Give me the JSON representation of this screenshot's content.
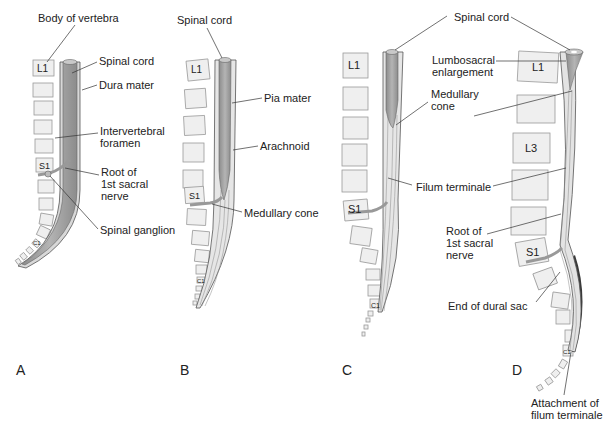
{
  "panels": [
    {
      "id": "A",
      "letter": "A",
      "vertebra_labels": [
        "L1",
        "S1",
        "C1"
      ],
      "labels": [
        {
          "text": "Body of vertebra"
        },
        {
          "text": "Spinal cord"
        },
        {
          "text": "Dura mater"
        },
        {
          "text": "Intervertebral\nforamen"
        },
        {
          "text": "Root of\n1st sacral\nnerve"
        },
        {
          "text": "Spinal ganglion"
        }
      ]
    },
    {
      "id": "B",
      "letter": "B",
      "vertebra_labels": [
        "L1",
        "S1",
        "C1"
      ],
      "labels": [
        {
          "text": "Spinal cord"
        },
        {
          "text": "Pia mater"
        },
        {
          "text": "Arachnoid"
        },
        {
          "text": "Medullary cone"
        }
      ]
    },
    {
      "id": "C",
      "letter": "C",
      "vertebra_labels": [
        "L1",
        "S1",
        "C1"
      ],
      "labels": [
        {
          "text": "Spinal cord"
        },
        {
          "text": "Medullary\ncone"
        },
        {
          "text": "Filum terminale"
        }
      ]
    },
    {
      "id": "D",
      "letter": "D",
      "vertebra_labels": [
        "L1",
        "L3",
        "S1",
        "C1"
      ],
      "labels": [
        {
          "text": "Lumbosacral\nenlargement"
        },
        {
          "text": "Root of\n1st sacral\nnerve"
        },
        {
          "text": "End of dural sac"
        },
        {
          "text": "Attachment of\nfilum terminale"
        }
      ]
    }
  ],
  "colors": {
    "cord": "#a8a8a8",
    "cord_dark": "#7a7a7a",
    "vertebra_fill": "#efefef",
    "vertebra_stroke": "#9a9a9a",
    "leader": "#333333",
    "dura_dark": "#3a3a3a"
  }
}
